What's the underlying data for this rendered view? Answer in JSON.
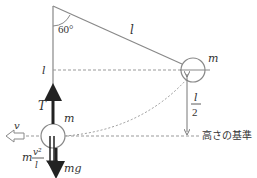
{
  "diagram": {
    "type": "pendulum-forces",
    "angle_label": "60°",
    "string_length_label": "l",
    "height_label_left": "l",
    "mass_upper": "m",
    "mass_lower": "m",
    "half_length": {
      "numerator": "l",
      "denominator": "2"
    },
    "reference_label": "高さの基準",
    "tension_label": "T",
    "velocity_label": "v",
    "centrifugal": {
      "prefix": "m",
      "numerator": "v²",
      "denominator": "l"
    },
    "weight_label": "mg",
    "colors": {
      "line": "#888888",
      "arrow": "#222222",
      "dash": "#999999"
    }
  }
}
